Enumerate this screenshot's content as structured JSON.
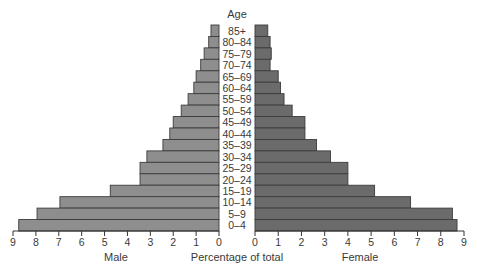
{
  "chart_data": {
    "type": "bar",
    "orientation": "horizontal-population-pyramid",
    "title": "Age",
    "xlabel": "Percentage of total",
    "categories": [
      "85+",
      "80–84",
      "75–79",
      "70–74",
      "65–69",
      "60–64",
      "55–59",
      "50–54",
      "45–49",
      "40–44",
      "35–39",
      "30–34",
      "25–29",
      "20–24",
      "15–19",
      "10–14",
      "5–9",
      "0–4"
    ],
    "series": [
      {
        "name": "Male",
        "color": "#8e8e8e",
        "values": [
          0.35,
          0.45,
          0.65,
          0.8,
          1.0,
          1.1,
          1.35,
          1.65,
          2.0,
          2.15,
          2.45,
          3.15,
          3.45,
          3.45,
          4.75,
          6.95,
          7.95,
          8.75
        ]
      },
      {
        "name": "Female",
        "color": "#6b6b6b",
        "values": [
          0.55,
          0.65,
          0.7,
          0.65,
          1.0,
          1.1,
          1.25,
          1.6,
          2.15,
          2.15,
          2.65,
          3.25,
          4.0,
          4.0,
          5.15,
          6.7,
          8.5,
          8.7
        ]
      }
    ],
    "xlim_male": [
      9,
      0
    ],
    "xlim_female": [
      0,
      9
    ],
    "left_ticks": [
      "9",
      "8",
      "7",
      "6",
      "5",
      "4",
      "3",
      "2",
      "1",
      "0"
    ],
    "right_ticks": [
      "0",
      "1",
      "2",
      "3",
      "4",
      "5",
      "6",
      "7",
      "8",
      "9"
    ],
    "left_axis_label": "Male",
    "right_axis_label": "Female",
    "grid": false,
    "legend": "none"
  }
}
